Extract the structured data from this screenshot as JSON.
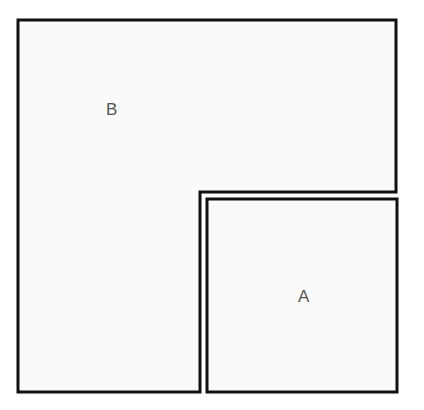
{
  "figure": {
    "canvas": {
      "width": 424,
      "height": 410
    },
    "background_color": "#ffffff",
    "fill_color": "#fafafa",
    "stroke_color": "#111111",
    "stroke_width": 3,
    "label_color": "#555555",
    "label_font_size": 17,
    "shapes": [
      {
        "id": "shape-b",
        "label": "B",
        "type": "polygon",
        "description": "L-shaped polygon occupying the upper band and lower-left column",
        "points": "18,20 396,20 396,192 200,192 200,392 18,392",
        "label_x": 112,
        "label_y": 111
      },
      {
        "id": "shape-a",
        "label": "A",
        "type": "rectangle",
        "description": "Square-ish rectangle nested in the lower-right notch",
        "x": 207,
        "y": 199,
        "width": 190,
        "height": 193,
        "points": "207,199 397,199 397,392 207,392",
        "label_x": 304,
        "label_y": 298
      }
    ]
  }
}
